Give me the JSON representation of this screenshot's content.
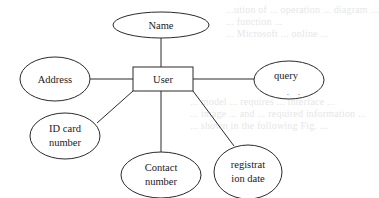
{
  "diagram": {
    "type": "er-diagram",
    "entity": {
      "id": "user",
      "label": "User"
    },
    "attributes": [
      {
        "id": "name",
        "lines": [
          "Name"
        ]
      },
      {
        "id": "address",
        "lines": [
          "Address"
        ]
      },
      {
        "id": "query-content",
        "lines": [
          "query",
          "content"
        ]
      },
      {
        "id": "id-card-number",
        "lines": [
          "ID card",
          "number"
        ]
      },
      {
        "id": "contact-number",
        "lines": [
          "Contact",
          "number"
        ]
      },
      {
        "id": "registration-date",
        "lines": [
          "registrat",
          "ion date"
        ]
      }
    ],
    "edges": [
      [
        "user",
        "name"
      ],
      [
        "user",
        "address"
      ],
      [
        "user",
        "query-content"
      ],
      [
        "user",
        "id-card-number"
      ],
      [
        "user",
        "contact-number"
      ],
      [
        "user",
        "registration-date"
      ]
    ]
  },
  "background_bleed": {
    "lines": [
      "...ution of ... operation ... diagram ...",
      "... function ...",
      "... Microsoft ... online ...",
      "... model ... requires ... interface ...",
      "... image ... and ... required information ...",
      "... shown in the following Fig. ..."
    ]
  }
}
